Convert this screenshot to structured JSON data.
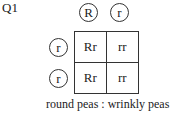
{
  "question_label": "Q1",
  "punnett_square": {
    "top_alleles": [
      "R",
      "r"
    ],
    "left_alleles": [
      "r",
      "r"
    ],
    "cells": [
      [
        "Rr",
        "rr"
      ],
      [
        "Rr",
        "rr"
      ]
    ]
  },
  "caption": "round peas : wrinkly peas"
}
